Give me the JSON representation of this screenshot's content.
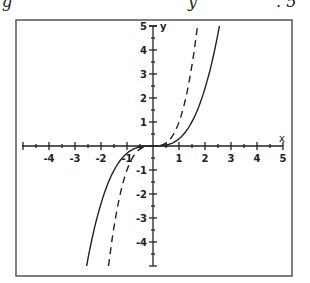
{
  "header_fragment": {
    "left": "g",
    "mid": "y",
    "right": ". 5"
  },
  "chart_data": {
    "type": "line",
    "title": "",
    "xlabel": "x",
    "ylabel": "y",
    "xlim": [
      -5,
      5
    ],
    "ylim": [
      -5,
      5
    ],
    "grid": false,
    "x_ticks": [
      -4,
      -3,
      -2,
      -1,
      1,
      2,
      3,
      4,
      5
    ],
    "y_ticks": [
      -4,
      -3,
      -2,
      -1,
      1,
      2,
      3,
      4,
      5
    ],
    "series": [
      {
        "name": "y = 0.3x^3 (solid)",
        "style": "solid",
        "x": [
          -2.55,
          -2.0,
          -1.5,
          -1.0,
          -0.5,
          0,
          0.5,
          1.0,
          1.5,
          2.0,
          2.55
        ],
        "y": [
          -5.0,
          -2.4,
          -1.0,
          -0.3,
          -0.04,
          0,
          0.04,
          0.3,
          1.0,
          2.4,
          5.0
        ]
      },
      {
        "name": "y = x^3 (dashed)",
        "style": "dashed",
        "x": [
          -1.71,
          -1.5,
          -1.2,
          -1.0,
          -0.7,
          -0.4,
          0,
          0.4,
          0.7,
          1.0,
          1.2,
          1.5,
          1.71
        ],
        "y": [
          -5.0,
          -3.4,
          -1.7,
          -1.0,
          -0.34,
          -0.06,
          0,
          0.06,
          0.34,
          1.0,
          1.7,
          3.4,
          5.0
        ]
      }
    ],
    "annotations": [
      "arrow near origin (first quadrant)",
      "arrow near origin (third quadrant)"
    ]
  }
}
